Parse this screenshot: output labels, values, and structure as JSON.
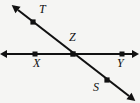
{
  "figure": {
    "kind": "geometry-line-diagram",
    "background_color": "#f5f5f3",
    "stroke_color": "#111111",
    "width": 140,
    "height": 103
  },
  "labels": {
    "T": "T",
    "X": "X",
    "Z": "Z",
    "Y": "Y",
    "S": "S"
  },
  "points": [
    {
      "name": "T",
      "x": 33,
      "y": 22,
      "label": "T",
      "label_x": 39,
      "label_y": 3
    },
    {
      "name": "X",
      "x": 35,
      "y": 54,
      "label": "X",
      "label_x": 33,
      "label_y": 57
    },
    {
      "name": "Z",
      "x": 73,
      "y": 54,
      "label": "Z",
      "label_x": 69,
      "label_y": 31
    },
    {
      "name": "Y",
      "x": 122,
      "y": 54,
      "label": "Y",
      "label_x": 117,
      "label_y": 57
    },
    {
      "name": "S",
      "x": 107,
      "y": 80,
      "label": "S",
      "label_x": 93,
      "label_y": 81
    }
  ],
  "lines": [
    {
      "name": "line-XY",
      "orientation": "horizontal",
      "x1": 7,
      "y1": 54,
      "x2": 132,
      "y2": 54,
      "arrow_start": true,
      "arrow_end": true,
      "through": [
        "X",
        "Z",
        "Y"
      ]
    },
    {
      "name": "line-TS",
      "orientation": "diagonal",
      "x1": 18,
      "y1": 10,
      "x2": 129,
      "y2": 96,
      "arrow_start": true,
      "arrow_end": true,
      "through": [
        "T",
        "Z",
        "S"
      ]
    }
  ]
}
